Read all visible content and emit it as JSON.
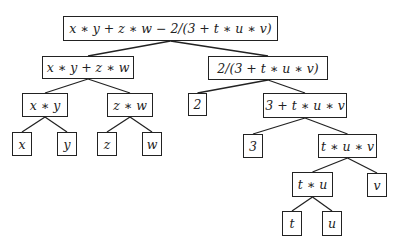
{
  "diagram": {
    "type": "expression-tree",
    "colors": {
      "stroke": "#222222",
      "background": "#ffffff",
      "text": "#222222"
    },
    "nodes": [
      {
        "id": "root",
        "label": "x ∗ y + z ∗ w − 2/(3 + t ∗ u ∗ v)",
        "x": 63,
        "y": 16,
        "w": 215,
        "h": 25
      },
      {
        "id": "n1",
        "label": "x ∗ y + z ∗ w",
        "x": 42,
        "y": 56,
        "w": 92,
        "h": 23
      },
      {
        "id": "n2",
        "label": "2/(3 + t ∗ u ∗ v)",
        "x": 208,
        "y": 56,
        "w": 120,
        "h": 24
      },
      {
        "id": "n3",
        "label": "x ∗ y",
        "x": 22,
        "y": 93,
        "w": 46,
        "h": 24
      },
      {
        "id": "n4",
        "label": "z ∗ w",
        "x": 107,
        "y": 93,
        "w": 46,
        "h": 24
      },
      {
        "id": "n5",
        "label": "2",
        "x": 188,
        "y": 93,
        "w": 19,
        "h": 23
      },
      {
        "id": "n6",
        "label": "3 + t ∗ u ∗ v",
        "x": 263,
        "y": 93,
        "w": 84,
        "h": 25
      },
      {
        "id": "x",
        "label": "x",
        "x": 12,
        "y": 132,
        "w": 20,
        "h": 24
      },
      {
        "id": "y",
        "label": "y",
        "x": 57,
        "y": 132,
        "w": 20,
        "h": 24
      },
      {
        "id": "z",
        "label": "z",
        "x": 97,
        "y": 132,
        "w": 20,
        "h": 24
      },
      {
        "id": "w",
        "label": "w",
        "x": 142,
        "y": 132,
        "w": 20,
        "h": 24
      },
      {
        "id": "n7",
        "label": "3",
        "x": 243,
        "y": 134,
        "w": 20,
        "h": 24
      },
      {
        "id": "n8",
        "label": "t ∗ u ∗ v",
        "x": 318,
        "y": 134,
        "w": 59,
        "h": 24
      },
      {
        "id": "n9",
        "label": "t ∗ u",
        "x": 292,
        "y": 172,
        "w": 41,
        "h": 25
      },
      {
        "id": "v",
        "label": "v",
        "x": 367,
        "y": 173,
        "w": 20,
        "h": 24
      },
      {
        "id": "t",
        "label": "t",
        "x": 282,
        "y": 211,
        "w": 20,
        "h": 25
      },
      {
        "id": "u",
        "label": "u",
        "x": 322,
        "y": 211,
        "w": 20,
        "h": 25
      }
    ],
    "edges": [
      [
        "root",
        "n1"
      ],
      [
        "root",
        "n2"
      ],
      [
        "n1",
        "n3"
      ],
      [
        "n1",
        "n4"
      ],
      [
        "n2",
        "n5"
      ],
      [
        "n2",
        "n6"
      ],
      [
        "n3",
        "x"
      ],
      [
        "n3",
        "y"
      ],
      [
        "n4",
        "z"
      ],
      [
        "n4",
        "w"
      ],
      [
        "n6",
        "n7"
      ],
      [
        "n6",
        "n8"
      ],
      [
        "n8",
        "n9"
      ],
      [
        "n8",
        "v"
      ],
      [
        "n9",
        "t"
      ],
      [
        "n9",
        "u"
      ]
    ]
  }
}
